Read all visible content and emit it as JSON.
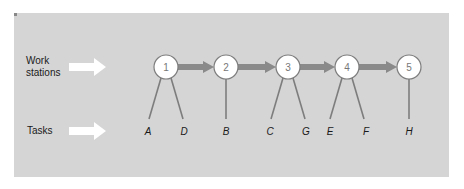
{
  "diagram": {
    "row_labels": {
      "work_stations": [
        "Work",
        "stations"
      ],
      "tasks": "Tasks"
    },
    "stations": [
      {
        "label": "1",
        "cx": 166,
        "tasks": [
          "A",
          "D"
        ]
      },
      {
        "label": "2",
        "cx": 226,
        "tasks": [
          "B"
        ]
      },
      {
        "label": "3",
        "cx": 288,
        "tasks": [
          "C",
          "G"
        ]
      },
      {
        "label": "4",
        "cx": 347,
        "tasks": [
          "E",
          "F"
        ]
      },
      {
        "label": "5",
        "cx": 409,
        "tasks": [
          "H"
        ]
      }
    ],
    "tasks": [
      {
        "label": "A",
        "x": 148,
        "station": "1"
      },
      {
        "label": "D",
        "x": 184,
        "station": "1"
      },
      {
        "label": "B",
        "x": 226,
        "station": "2"
      },
      {
        "label": "C",
        "x": 270,
        "station": "3"
      },
      {
        "label": "G",
        "x": 306,
        "station": "3"
      },
      {
        "label": "E",
        "x": 330,
        "station": "4"
      },
      {
        "label": "F",
        "x": 366,
        "station": "4"
      },
      {
        "label": "H",
        "x": 409,
        "station": "5"
      }
    ],
    "colors": {
      "panel": "#d5d5d5",
      "flow_arrow": "#8a8a8a",
      "line": "#7d7d7d",
      "node_fill": "#ffffff",
      "pointer_arrow": "#ffffff"
    }
  }
}
